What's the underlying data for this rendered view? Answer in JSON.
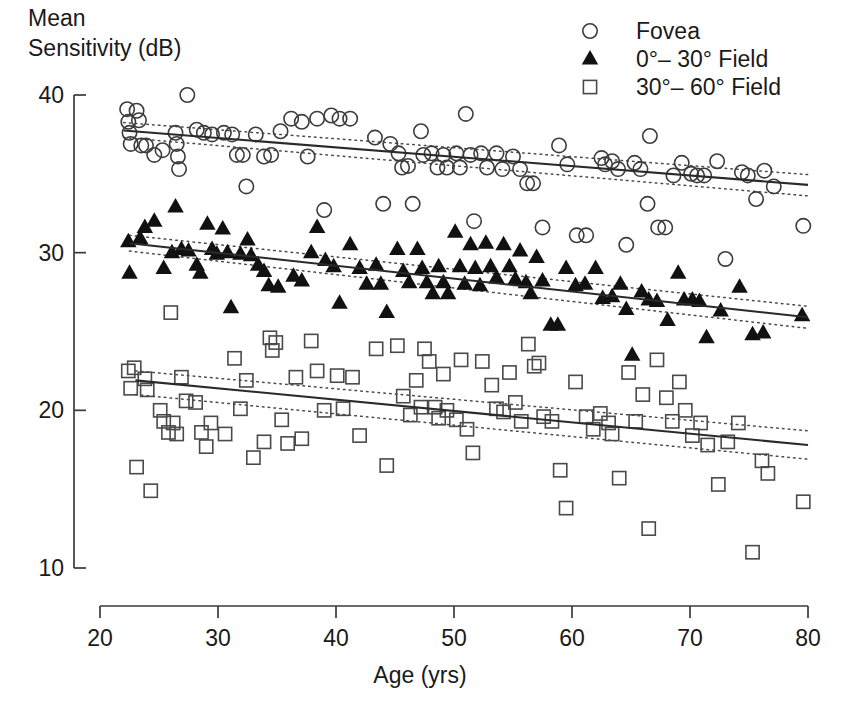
{
  "chart_data": {
    "type": "scatter",
    "title": "",
    "xlabel": "Age (yrs)",
    "ylabel": "Mean Sensitivity (dB)",
    "ylabel_line1": "Mean",
    "ylabel_line2": "Sensitivity (dB)",
    "xlim": [
      20,
      80
    ],
    "ylim": [
      10,
      40
    ],
    "xticks": [
      20,
      30,
      40,
      50,
      60,
      70,
      80
    ],
    "xtick_labels": [
      "20",
      "30",
      "40",
      "50",
      "60",
      "70",
      "80"
    ],
    "yticks": [
      10,
      20,
      30,
      40
    ],
    "ytick_labels": [
      "10",
      "20",
      "30",
      "40"
    ],
    "grid": false,
    "legend_position": "top-right",
    "legend": [
      {
        "label": "Fovea",
        "marker": "open-circle"
      },
      {
        "label": "0°– 30° Field",
        "marker": "filled-triangle"
      },
      {
        "label": "30°– 60° Field",
        "marker": "open-square"
      }
    ],
    "series": [
      {
        "name": "Fovea",
        "marker": "open-circle",
        "fit_line": {
          "x": [
            22,
            80
          ],
          "y": [
            37.75,
            34.3
          ]
        },
        "ci_upper": {
          "x": [
            22,
            80
          ],
          "y": [
            38.25,
            34.95
          ]
        },
        "ci_lower": {
          "x": [
            22,
            80
          ],
          "y": [
            37.3,
            33.6
          ]
        },
        "points": [
          [
            22.3,
            39.1
          ],
          [
            22.4,
            38.3
          ],
          [
            22.5,
            37.6
          ],
          [
            22.6,
            36.9
          ],
          [
            23.1,
            39.0
          ],
          [
            23.3,
            38.4
          ],
          [
            23.5,
            36.8
          ],
          [
            23.9,
            36.8
          ],
          [
            24.6,
            36.2
          ],
          [
            25.3,
            36.5
          ],
          [
            26.4,
            37.6
          ],
          [
            26.5,
            36.9
          ],
          [
            26.6,
            36.1
          ],
          [
            26.7,
            35.3
          ],
          [
            27.4,
            40.0
          ],
          [
            28.2,
            37.8
          ],
          [
            28.8,
            37.6
          ],
          [
            29.5,
            37.5
          ],
          [
            30.5,
            37.6
          ],
          [
            31.2,
            37.5
          ],
          [
            31.6,
            36.2
          ],
          [
            32.1,
            36.2
          ],
          [
            32.4,
            34.2
          ],
          [
            33.2,
            37.5
          ],
          [
            33.9,
            36.1
          ],
          [
            34.5,
            36.2
          ],
          [
            35.3,
            37.7
          ],
          [
            36.2,
            38.5
          ],
          [
            37.1,
            38.3
          ],
          [
            37.6,
            36.1
          ],
          [
            38.4,
            38.5
          ],
          [
            39.0,
            32.7
          ],
          [
            39.6,
            38.7
          ],
          [
            40.3,
            38.5
          ],
          [
            41.2,
            38.5
          ],
          [
            43.3,
            37.3
          ],
          [
            44.0,
            33.1
          ],
          [
            44.6,
            36.9
          ],
          [
            45.3,
            36.3
          ],
          [
            45.6,
            35.4
          ],
          [
            46.1,
            35.5
          ],
          [
            46.5,
            33.1
          ],
          [
            47.2,
            37.7
          ],
          [
            47.4,
            36.2
          ],
          [
            48.1,
            36.3
          ],
          [
            48.6,
            35.4
          ],
          [
            49.1,
            36.2
          ],
          [
            49.4,
            35.4
          ],
          [
            50.2,
            36.3
          ],
          [
            50.5,
            35.4
          ],
          [
            51.0,
            38.8
          ],
          [
            51.4,
            36.2
          ],
          [
            51.7,
            32.0
          ],
          [
            52.3,
            36.3
          ],
          [
            52.8,
            35.4
          ],
          [
            53.6,
            36.3
          ],
          [
            54.1,
            35.3
          ],
          [
            55.0,
            36.1
          ],
          [
            55.6,
            35.3
          ],
          [
            56.2,
            34.4
          ],
          [
            56.7,
            34.4
          ],
          [
            57.5,
            31.6
          ],
          [
            58.9,
            36.8
          ],
          [
            59.6,
            35.6
          ],
          [
            60.4,
            31.1
          ],
          [
            61.2,
            31.1
          ],
          [
            62.5,
            36.0
          ],
          [
            62.8,
            35.6
          ],
          [
            63.4,
            35.8
          ],
          [
            63.9,
            35.3
          ],
          [
            64.6,
            30.5
          ],
          [
            65.3,
            35.7
          ],
          [
            65.8,
            35.3
          ],
          [
            66.4,
            33.1
          ],
          [
            66.6,
            37.4
          ],
          [
            67.3,
            31.6
          ],
          [
            67.9,
            31.6
          ],
          [
            68.6,
            34.9
          ],
          [
            69.3,
            35.7
          ],
          [
            70.1,
            35.0
          ],
          [
            70.6,
            34.9
          ],
          [
            71.2,
            34.9
          ],
          [
            72.3,
            35.8
          ],
          [
            73.0,
            29.6
          ],
          [
            74.4,
            35.1
          ],
          [
            74.9,
            34.9
          ],
          [
            75.6,
            33.4
          ],
          [
            76.3,
            35.2
          ],
          [
            77.1,
            34.2
          ],
          [
            79.6,
            31.7
          ]
        ]
      },
      {
        "name": "0°– 30° Field",
        "marker": "filled-triangle",
        "fit_line": {
          "x": [
            22.5,
            80
          ],
          "y": [
            30.6,
            25.9
          ]
        },
        "ci_upper": {
          "x": [
            22.5,
            80
          ],
          "y": [
            31.1,
            26.6
          ]
        },
        "ci_lower": {
          "x": [
            22.5,
            80
          ],
          "y": [
            30.1,
            25.2
          ]
        },
        "points": [
          [
            22.4,
            30.7
          ],
          [
            22.5,
            28.7
          ],
          [
            23.4,
            30.9
          ],
          [
            23.8,
            31.6
          ],
          [
            24.6,
            32.0
          ],
          [
            25.4,
            29.0
          ],
          [
            26.1,
            30.0
          ],
          [
            26.4,
            32.9
          ],
          [
            26.9,
            30.2
          ],
          [
            27.5,
            30.1
          ],
          [
            28.2,
            29.2
          ],
          [
            28.5,
            28.7
          ],
          [
            29.1,
            31.8
          ],
          [
            29.5,
            30.2
          ],
          [
            29.9,
            29.9
          ],
          [
            30.4,
            31.5
          ],
          [
            30.8,
            30.0
          ],
          [
            31.1,
            26.5
          ],
          [
            31.9,
            29.9
          ],
          [
            32.5,
            30.8
          ],
          [
            32.8,
            29.8
          ],
          [
            33.4,
            29.2
          ],
          [
            33.9,
            28.8
          ],
          [
            34.3,
            27.9
          ],
          [
            35.1,
            27.8
          ],
          [
            36.4,
            28.5
          ],
          [
            37.1,
            28.2
          ],
          [
            37.9,
            30.0
          ],
          [
            38.4,
            31.6
          ],
          [
            39.1,
            29.5
          ],
          [
            39.8,
            29.1
          ],
          [
            40.3,
            26.8
          ],
          [
            41.2,
            30.5
          ],
          [
            42.0,
            29.0
          ],
          [
            42.6,
            28.0
          ],
          [
            43.4,
            29.2
          ],
          [
            43.8,
            28.0
          ],
          [
            44.3,
            26.2
          ],
          [
            45.2,
            30.2
          ],
          [
            45.7,
            28.8
          ],
          [
            46.2,
            28.1
          ],
          [
            46.9,
            30.2
          ],
          [
            47.3,
            29.0
          ],
          [
            47.7,
            28.1
          ],
          [
            48.2,
            27.4
          ],
          [
            48.7,
            29.1
          ],
          [
            49.1,
            28.1
          ],
          [
            49.5,
            27.4
          ],
          [
            50.1,
            31.3
          ],
          [
            50.5,
            29.1
          ],
          [
            50.9,
            28.0
          ],
          [
            51.4,
            30.5
          ],
          [
            51.8,
            29.0
          ],
          [
            52.2,
            27.9
          ],
          [
            52.7,
            30.6
          ],
          [
            53.1,
            29.1
          ],
          [
            53.6,
            28.4
          ],
          [
            54.2,
            30.5
          ],
          [
            54.7,
            29.1
          ],
          [
            55.2,
            28.3
          ],
          [
            55.6,
            30.1
          ],
          [
            56.1,
            28.1
          ],
          [
            56.5,
            27.4
          ],
          [
            57.0,
            29.7
          ],
          [
            57.5,
            28.2
          ],
          [
            58.2,
            25.4
          ],
          [
            58.8,
            25.4
          ],
          [
            59.5,
            29.0
          ],
          [
            60.3,
            27.9
          ],
          [
            61.1,
            28.0
          ],
          [
            62.0,
            29.0
          ],
          [
            62.6,
            27.1
          ],
          [
            63.4,
            27.2
          ],
          [
            64.1,
            28.0
          ],
          [
            64.6,
            26.4
          ],
          [
            65.1,
            23.5
          ],
          [
            65.9,
            27.5
          ],
          [
            66.5,
            27.0
          ],
          [
            67.2,
            26.9
          ],
          [
            68.1,
            25.7
          ],
          [
            69.0,
            28.7
          ],
          [
            69.5,
            27.0
          ],
          [
            70.2,
            27.0
          ],
          [
            70.8,
            26.9
          ],
          [
            71.4,
            24.6
          ],
          [
            72.6,
            26.3
          ],
          [
            74.2,
            27.8
          ],
          [
            75.3,
            24.8
          ],
          [
            76.2,
            24.9
          ],
          [
            79.5,
            26.0
          ]
        ]
      },
      {
        "name": "30°– 60° Field",
        "marker": "open-square",
        "fit_line": {
          "x": [
            23,
            80
          ],
          "y": [
            21.9,
            17.8
          ]
        },
        "ci_upper": {
          "x": [
            23,
            80
          ],
          "y": [
            22.5,
            18.7
          ]
        },
        "ci_lower": {
          "x": [
            23,
            80
          ],
          "y": [
            21.0,
            16.9
          ]
        },
        "points": [
          [
            22.4,
            22.5
          ],
          [
            22.6,
            21.4
          ],
          [
            22.9,
            22.7
          ],
          [
            23.1,
            16.4
          ],
          [
            23.8,
            22.0
          ],
          [
            24.0,
            21.3
          ],
          [
            24.3,
            14.9
          ],
          [
            25.1,
            20.0
          ],
          [
            25.4,
            19.3
          ],
          [
            25.8,
            18.6
          ],
          [
            26.0,
            26.2
          ],
          [
            26.2,
            19.2
          ],
          [
            26.5,
            18.5
          ],
          [
            26.9,
            22.1
          ],
          [
            27.3,
            20.6
          ],
          [
            28.1,
            20.5
          ],
          [
            28.6,
            18.6
          ],
          [
            29.0,
            17.7
          ],
          [
            29.4,
            19.2
          ],
          [
            30.6,
            18.5
          ],
          [
            31.4,
            23.3
          ],
          [
            31.9,
            20.1
          ],
          [
            32.4,
            21.9
          ],
          [
            33.0,
            17.0
          ],
          [
            33.9,
            18.0
          ],
          [
            34.4,
            24.6
          ],
          [
            34.6,
            23.8
          ],
          [
            34.9,
            24.3
          ],
          [
            35.4,
            19.4
          ],
          [
            35.9,
            17.9
          ],
          [
            36.6,
            22.1
          ],
          [
            37.1,
            18.2
          ],
          [
            37.9,
            24.4
          ],
          [
            38.4,
            22.5
          ],
          [
            39.0,
            20.0
          ],
          [
            40.1,
            22.2
          ],
          [
            40.6,
            20.1
          ],
          [
            41.4,
            22.1
          ],
          [
            42.0,
            18.4
          ],
          [
            43.4,
            23.9
          ],
          [
            44.3,
            16.5
          ],
          [
            45.2,
            24.1
          ],
          [
            45.7,
            20.9
          ],
          [
            46.3,
            19.7
          ],
          [
            46.8,
            21.9
          ],
          [
            47.2,
            20.2
          ],
          [
            47.5,
            23.9
          ],
          [
            47.9,
            23.1
          ],
          [
            48.4,
            20.2
          ],
          [
            48.7,
            19.5
          ],
          [
            49.1,
            22.3
          ],
          [
            49.4,
            20.0
          ],
          [
            50.2,
            19.4
          ],
          [
            50.6,
            23.2
          ],
          [
            51.1,
            18.8
          ],
          [
            51.6,
            17.3
          ],
          [
            52.4,
            23.1
          ],
          [
            53.2,
            21.6
          ],
          [
            53.6,
            20.1
          ],
          [
            54.2,
            19.9
          ],
          [
            54.7,
            22.4
          ],
          [
            55.2,
            20.5
          ],
          [
            55.7,
            19.3
          ],
          [
            56.3,
            24.2
          ],
          [
            56.8,
            22.8
          ],
          [
            57.2,
            23.0
          ],
          [
            57.6,
            19.6
          ],
          [
            58.3,
            19.3
          ],
          [
            59.0,
            16.2
          ],
          [
            59.5,
            13.8
          ],
          [
            60.3,
            21.8
          ],
          [
            61.2,
            19.6
          ],
          [
            61.8,
            18.8
          ],
          [
            62.4,
            19.8
          ],
          [
            63.1,
            19.2
          ],
          [
            63.4,
            18.5
          ],
          [
            64.0,
            15.7
          ],
          [
            64.8,
            22.4
          ],
          [
            65.4,
            19.3
          ],
          [
            66.0,
            21.0
          ],
          [
            66.5,
            12.5
          ],
          [
            67.2,
            23.2
          ],
          [
            68.0,
            20.8
          ],
          [
            68.5,
            19.3
          ],
          [
            69.1,
            21.8
          ],
          [
            69.6,
            20.0
          ],
          [
            70.2,
            18.4
          ],
          [
            70.9,
            19.2
          ],
          [
            71.5,
            17.8
          ],
          [
            72.4,
            15.3
          ],
          [
            73.2,
            18.0
          ],
          [
            74.1,
            19.2
          ],
          [
            75.3,
            11.0
          ],
          [
            76.1,
            16.8
          ],
          [
            76.6,
            16.0
          ],
          [
            79.6,
            14.2
          ]
        ]
      }
    ]
  }
}
